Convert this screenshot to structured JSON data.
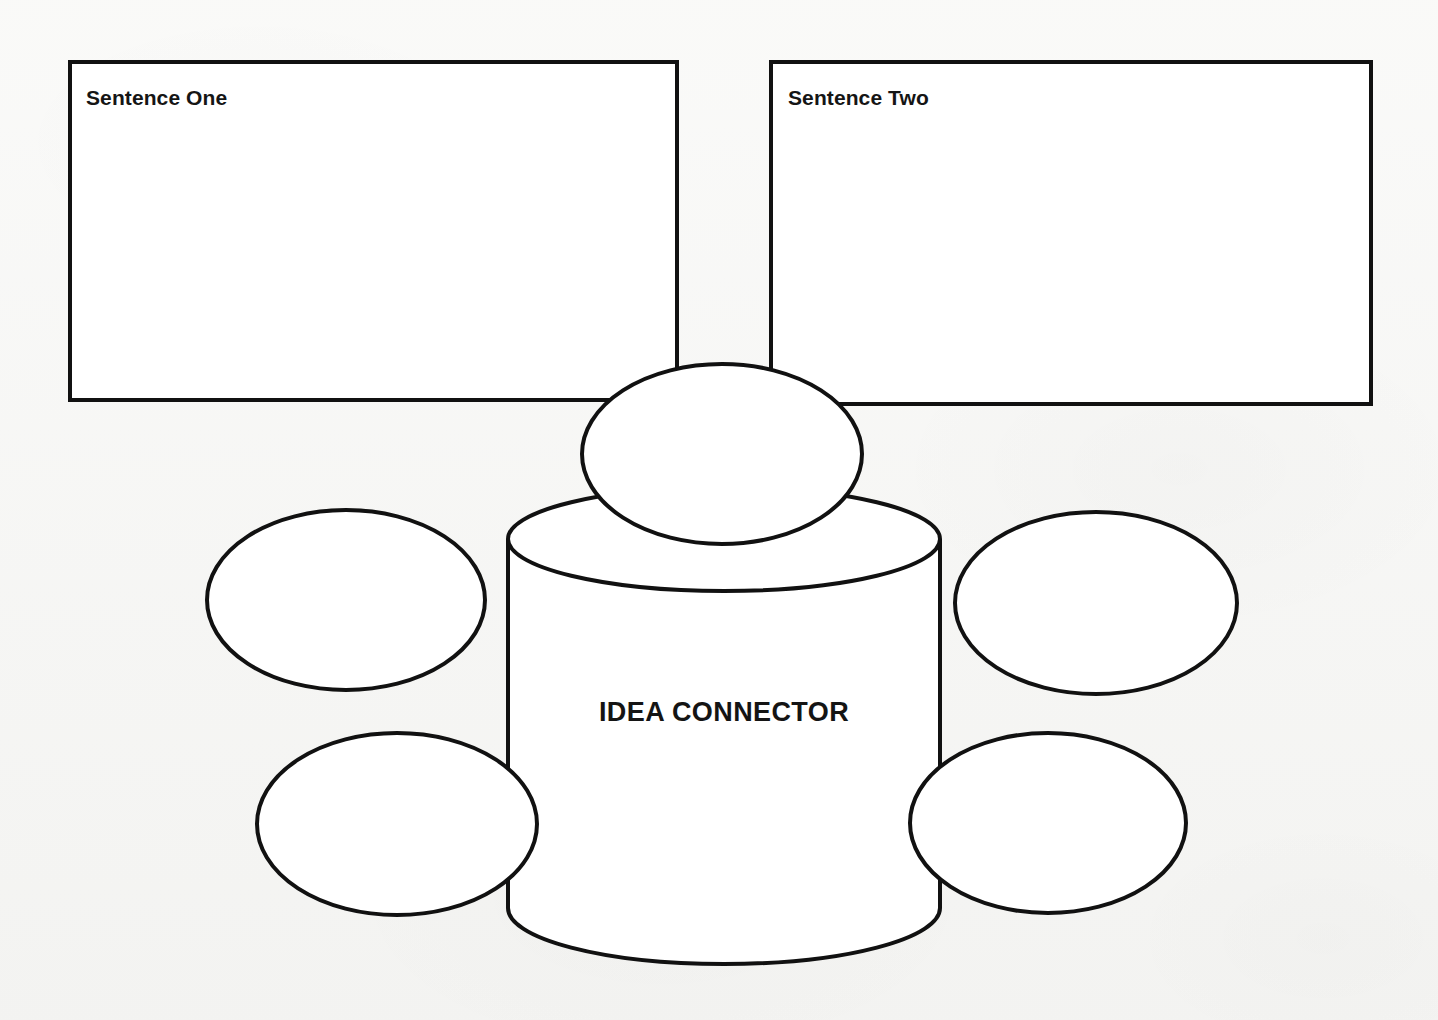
{
  "page": {
    "background_color": "#f7f7f5",
    "ink_color": "#111111"
  },
  "boxes": [
    {
      "id": "sentence-one",
      "label": "Sentence One",
      "value": ""
    },
    {
      "id": "sentence-two",
      "label": "Sentence Two",
      "value": ""
    }
  ],
  "center": {
    "label": "IDEA CONNECTOR",
    "shape": "cylinder"
  },
  "bubbles": [
    {
      "id": "bubble-top",
      "position": "top",
      "value": ""
    },
    {
      "id": "bubble-upper-left",
      "position": "upper-left",
      "value": ""
    },
    {
      "id": "bubble-upper-right",
      "position": "upper-right",
      "value": ""
    },
    {
      "id": "bubble-lower-left",
      "position": "lower-left",
      "value": ""
    },
    {
      "id": "bubble-lower-right",
      "position": "lower-right",
      "value": ""
    }
  ]
}
